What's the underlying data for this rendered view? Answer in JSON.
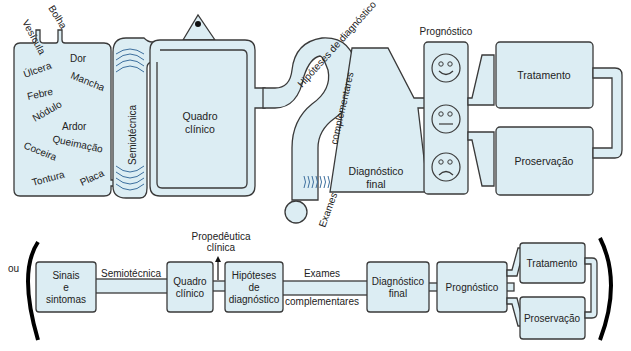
{
  "colors": {
    "fill": "#dcedf3",
    "stroke": "#3a3a3a",
    "wave": "#3d6f9e"
  },
  "top": {
    "inputs": [
      "Vesícula",
      "Bolha"
    ],
    "symptoms": [
      "Dor",
      "Úlcera",
      "Mancha",
      "Febre",
      "Nódulo",
      "Ardor",
      "Coceira",
      "Queimação",
      "Tontura",
      "Placa"
    ],
    "semiotecnica": "Semiotécnica",
    "quadro": [
      "Quadro",
      "clínico"
    ],
    "hipoteses": "Hipóteses de diagnóstico",
    "complementares": "complementares",
    "exames": "Exames",
    "diagnostico": [
      "Diagnóstico",
      "final"
    ],
    "prognostico": "Prognóstico",
    "tratamento": "Tratamento",
    "proservacao": "Proservação"
  },
  "bottom": {
    "ou": "ou",
    "sinais": [
      "Sinais",
      "e",
      "sintomas"
    ],
    "semiotecnica": "Semiotécnica",
    "quadro": [
      "Quadro",
      "clínico"
    ],
    "propedeutica": [
      "Propedêutica",
      "clínica"
    ],
    "hipoteses": [
      "Hipóteses",
      "de",
      "diagnóstico"
    ],
    "exames": "Exames",
    "complementares": "complementares",
    "diagnostico": [
      "Diagnóstico",
      "final"
    ],
    "prognostico": "Prognóstico",
    "tratamento": "Tratamento",
    "proservacao": "Proservação"
  }
}
